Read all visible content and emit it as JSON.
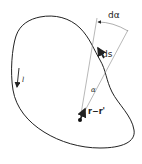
{
  "diagram": {
    "labels": {
      "d_alpha": "dα",
      "ds": "ds",
      "alpha": "α",
      "r_minus_r_prime": "r−r'",
      "current_loop": "l"
    },
    "colors": {
      "stroke": "#222222",
      "thin_line": "#777777",
      "background": "#ffffff"
    }
  }
}
